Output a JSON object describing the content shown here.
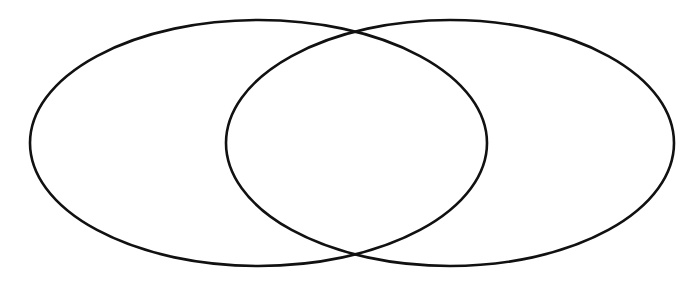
{
  "diagram": {
    "type": "venn",
    "background": "#ffffff",
    "stroke_color": "#111111",
    "stroke_width": 2.6,
    "sets": [
      {
        "id": "left",
        "label": "",
        "cx": 258.5,
        "cy": 143,
        "rx": 228.5,
        "ry": 123
      },
      {
        "id": "right",
        "label": "",
        "cx": 450,
        "cy": 143,
        "rx": 224,
        "ry": 123
      }
    ],
    "intersection_label": ""
  }
}
